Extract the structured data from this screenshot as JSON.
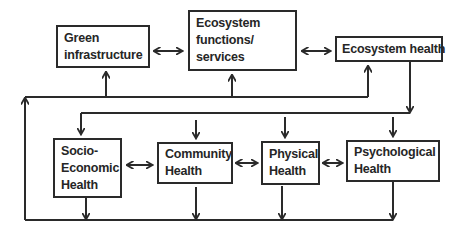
{
  "diagram": {
    "nodes": {
      "green_infrastructure": {
        "lines": [
          "Green",
          "infrastructure"
        ]
      },
      "ecosystem_services": {
        "lines": [
          "Ecosystem",
          "functions/",
          "services"
        ]
      },
      "ecosystem_health": {
        "lines": [
          "Ecosystem health"
        ]
      },
      "socio_economic_health": {
        "lines": [
          "Socio-",
          "Economic",
          "Health"
        ]
      },
      "community_health": {
        "lines": [
          "Community",
          "Health"
        ]
      },
      "physical_health": {
        "lines": [
          "Physical",
          "Health"
        ]
      },
      "psychological_health": {
        "lines": [
          "Psychological",
          "Health"
        ]
      }
    },
    "edges": [
      {
        "from": "Green infrastructure",
        "to": "Ecosystem functions/services",
        "type": "bidirectional"
      },
      {
        "from": "Ecosystem functions/services",
        "to": "Ecosystem health",
        "type": "bidirectional"
      },
      {
        "from": "Ecosystem health",
        "to": [
          "Socio-Economic Health",
          "Community Health",
          "Physical Health",
          "Psychological Health"
        ],
        "type": "directed"
      },
      {
        "from": "Socio-Economic Health",
        "to": "Community Health",
        "type": "bidirectional"
      },
      {
        "from": "Community Health",
        "to": "Physical Health",
        "type": "bidirectional"
      },
      {
        "from": "Physical Health",
        "to": "Psychological Health",
        "type": "bidirectional"
      },
      {
        "from": [
          "Socio-Economic Health",
          "Community Health",
          "Physical Health",
          "Psychological Health"
        ],
        "to": [
          "Green infrastructure",
          "Ecosystem functions/services",
          "Ecosystem health"
        ],
        "type": "feedback-loop"
      }
    ],
    "colors": {
      "line": "#2a2a2a",
      "text": "#262626",
      "background": "#ffffff"
    }
  }
}
